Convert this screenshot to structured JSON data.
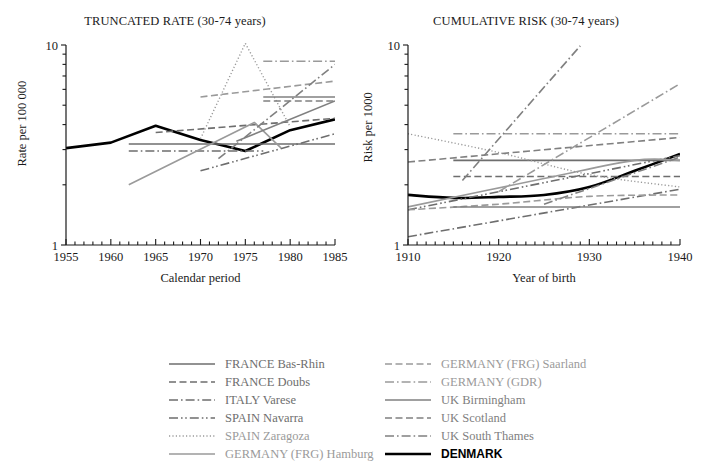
{
  "figure": {
    "background": "#ffffff",
    "width": 702,
    "height": 470
  },
  "panels": {
    "left": {
      "title": "TRUNCATED RATE (30-74 years)",
      "ylabel": "Rate per 100 000",
      "xlabel": "Calendar period",
      "ytick_top": "10",
      "ytick_bottom": "1",
      "xticks": [
        "1955",
        "1960",
        "1965",
        "1970",
        "1975",
        "1980",
        "1985"
      ]
    },
    "right": {
      "title": "CUMULATIVE RISK (30-74 years)",
      "ylabel": "Risk per 1000",
      "xlabel": "Year of birth",
      "ytick_top": "10",
      "ytick_bottom": "1",
      "xticks": [
        "1910",
        "1920",
        "1930",
        "1940"
      ]
    }
  },
  "legend": {
    "columns": [
      [
        {
          "label": "FRANCE Bas-Rhin",
          "style": "solid",
          "color": "#6e6e6e",
          "width": 1.6
        },
        {
          "label": "FRANCE Doubs",
          "style": "dashed",
          "color": "#6e6e6e",
          "width": 1.6
        },
        {
          "label": "ITALY Varese",
          "style": "dashdot",
          "color": "#6e6e6e",
          "width": 1.6
        },
        {
          "label": "SPAIN Navarra",
          "style": "dashdotdot",
          "color": "#6e6e6e",
          "width": 1.6
        },
        {
          "label": "SPAIN Zaragoza",
          "style": "dotted",
          "color": "#9a9a9a",
          "width": 1.4
        },
        {
          "label": "GERMANY (FRG) Hamburg",
          "style": "solid",
          "color": "#9a9a9a",
          "width": 1.6
        }
      ],
      [
        {
          "label": "GERMANY (FRG) Saarland",
          "style": "dashed",
          "color": "#9a9a9a",
          "width": 1.6
        },
        {
          "label": "GERMANY (GDR)",
          "style": "dashdot",
          "color": "#9a9a9a",
          "width": 1.6
        },
        {
          "label": "UK Birmingham",
          "style": "solid",
          "color": "#808080",
          "width": 1.6
        },
        {
          "label": "UK Scotland",
          "style": "dashed",
          "color": "#808080",
          "width": 1.6
        },
        {
          "label": "UK South Thames",
          "style": "dashdot",
          "color": "#808080",
          "width": 1.6
        },
        {
          "label": "DENMARK",
          "style": "solid",
          "color": "#000000",
          "width": 2.6
        }
      ]
    ]
  },
  "chart_data": [
    {
      "id": "truncated-rate",
      "type": "line",
      "title": "TRUNCATED RATE (30-74 years)",
      "xlabel": "Calendar period",
      "ylabel": "Rate per 100 000",
      "xlim": [
        1955,
        1985
      ],
      "ylim": [
        1,
        10
      ],
      "yscale": "log",
      "xticks": [
        1955,
        1960,
        1965,
        1970,
        1975,
        1980,
        1985
      ],
      "yticks": [
        1,
        10
      ],
      "yminor": [
        2,
        3,
        4,
        5,
        6,
        7,
        8,
        9
      ],
      "grid": false,
      "legend_position": "below-figure",
      "series": [
        {
          "name": "DENMARK",
          "style": "solid",
          "color": "#000000",
          "width": 2.6,
          "x": [
            1955,
            1960,
            1965,
            1970,
            1975,
            1980,
            1985
          ],
          "y": [
            3.05,
            3.25,
            3.95,
            3.35,
            2.95,
            3.75,
            4.25
          ]
        },
        {
          "name": "FRANCE Bas-Rhin",
          "style": "solid",
          "color": "#6e6e6e",
          "width": 1.6,
          "x": [
            1962,
            1985
          ],
          "y": [
            3.2,
            3.2
          ]
        },
        {
          "name": "FRANCE Doubs",
          "style": "dashed",
          "color": "#6e6e6e",
          "width": 1.6,
          "x": [
            1965,
            1985
          ],
          "y": [
            3.65,
            4.3
          ]
        },
        {
          "name": "ITALY Varese",
          "style": "dashdot",
          "color": "#6e6e6e",
          "width": 1.6,
          "x": [
            1962,
            1977
          ],
          "y": [
            2.95,
            2.95
          ]
        },
        {
          "name": "SPAIN Navarra",
          "style": "dashdotdot",
          "color": "#6e6e6e",
          "width": 1.6,
          "x": [
            1970,
            1985
          ],
          "y": [
            2.35,
            3.6
          ]
        },
        {
          "name": "SPAIN Zaragoza",
          "style": "dotted",
          "color": "#9a9a9a",
          "width": 1.4,
          "x": [
            1970,
            1975,
            1980
          ],
          "y": [
            3.4,
            10.2,
            3.9
          ]
        },
        {
          "name": "GERMANY (FRG) Hamburg",
          "style": "solid",
          "color": "#9a9a9a",
          "width": 1.6,
          "x": [
            1962,
            1976,
            1979
          ],
          "y": [
            2.0,
            4.1,
            3.05
          ]
        },
        {
          "name": "GERMANY (FRG) Saarland",
          "style": "dashed",
          "color": "#9a9a9a",
          "width": 1.6,
          "x": [
            1970,
            1985
          ],
          "y": [
            5.5,
            6.6
          ]
        },
        {
          "name": "GERMANY (GDR)",
          "style": "dashdot",
          "color": "#9a9a9a",
          "width": 1.6,
          "x": [
            1977,
            1985
          ],
          "y": [
            8.3,
            8.3
          ]
        },
        {
          "name": "UK Birmingham",
          "style": "solid",
          "color": "#808080",
          "width": 1.6,
          "x": [
            1977,
            1985
          ],
          "y": [
            5.5,
            5.5
          ]
        },
        {
          "name": "UK Scotland",
          "style": "dashed",
          "color": "#808080",
          "width": 1.6,
          "x": [
            1977,
            1985
          ],
          "y": [
            5.25,
            5.25
          ]
        },
        {
          "name": "UK South Thames",
          "style": "dashdot",
          "color": "#808080",
          "width": 1.6,
          "x": [
            1972,
            1985
          ],
          "y": [
            2.7,
            8.0
          ]
        },
        {
          "name": "UK Birmingham trend",
          "style": "solid",
          "color": "#808080",
          "width": 1.6,
          "x": [
            1974,
            1985
          ],
          "y": [
            3.3,
            5.25
          ]
        }
      ]
    },
    {
      "id": "cumulative-risk",
      "type": "line",
      "title": "CUMULATIVE RISK (30-74 years)",
      "xlabel": "Year of birth",
      "ylabel": "Risk per 1000",
      "xlim": [
        1910,
        1940
      ],
      "ylim": [
        1,
        10
      ],
      "yscale": "log",
      "xticks": [
        1910,
        1920,
        1930,
        1940
      ],
      "yticks": [
        1,
        10
      ],
      "yminor": [
        2,
        3,
        4,
        5,
        6,
        7,
        8,
        9
      ],
      "grid": false,
      "legend_position": "below-figure",
      "series": [
        {
          "name": "DENMARK",
          "style": "solid",
          "color": "#000000",
          "width": 2.6,
          "x": [
            1910,
            1915,
            1920,
            1925,
            1930,
            1935,
            1940
          ],
          "y": [
            1.78,
            1.72,
            1.74,
            1.78,
            1.95,
            2.35,
            2.85
          ]
        },
        {
          "name": "FRANCE Bas-Rhin",
          "style": "solid",
          "color": "#6e6e6e",
          "width": 1.6,
          "x": [
            1915,
            1940
          ],
          "y": [
            2.65,
            2.65
          ]
        },
        {
          "name": "FRANCE Doubs",
          "style": "dashed",
          "color": "#6e6e6e",
          "width": 1.6,
          "x": [
            1915,
            1940
          ],
          "y": [
            2.2,
            2.2
          ]
        },
        {
          "name": "ITALY Varese",
          "style": "dashdot",
          "color": "#6e6e6e",
          "width": 1.6,
          "x": [
            1910,
            1940
          ],
          "y": [
            1.1,
            1.9
          ]
        },
        {
          "name": "SPAIN Navarra",
          "style": "dashdotdot",
          "color": "#6e6e6e",
          "width": 1.6,
          "x": [
            1910,
            1940
          ],
          "y": [
            1.5,
            2.8
          ]
        },
        {
          "name": "SPAIN Zaragoza",
          "style": "dotted",
          "color": "#9a9a9a",
          "width": 1.4,
          "x": [
            1910,
            1920,
            1930,
            1940
          ],
          "y": [
            3.6,
            2.9,
            2.25,
            1.95
          ]
        },
        {
          "name": "GERMANY (FRG) Hamburg",
          "style": "solid",
          "color": "#9a9a9a",
          "width": 1.6,
          "x": [
            1910,
            1925,
            1935,
            1940
          ],
          "y": [
            1.55,
            2.15,
            2.65,
            2.65
          ]
        },
        {
          "name": "GERMANY (FRG) Saarland",
          "style": "dashed",
          "color": "#9a9a9a",
          "width": 1.6,
          "x": [
            1910,
            1920,
            1930,
            1940
          ],
          "y": [
            1.5,
            1.6,
            1.75,
            1.78
          ]
        },
        {
          "name": "GERMANY (GDR)",
          "style": "dashdot",
          "color": "#9a9a9a",
          "width": 1.6,
          "x": [
            1915,
            1940
          ],
          "y": [
            3.6,
            3.6
          ]
        },
        {
          "name": "UK Birmingham",
          "style": "solid",
          "color": "#808080",
          "width": 1.6,
          "x": [
            1915,
            1940
          ],
          "y": [
            1.55,
            1.55
          ]
        },
        {
          "name": "UK Scotland",
          "style": "dashed",
          "color": "#808080",
          "width": 1.6,
          "x": [
            1910,
            1940
          ],
          "y": [
            2.6,
            3.45
          ]
        },
        {
          "name": "UK South Thames",
          "style": "dashdot",
          "color": "#808080",
          "width": 1.6,
          "x": [
            1916,
            1929
          ],
          "y": [
            2.1,
            9.9
          ]
        },
        {
          "name": "GERMANY (GDR) cohort",
          "style": "dashdot",
          "color": "#9a9a9a",
          "width": 1.6,
          "x": [
            1920,
            1940
          ],
          "y": [
            1.85,
            6.4
          ]
        },
        {
          "name": "UK Scotland cohort",
          "style": "dashdot",
          "color": "#808080",
          "width": 1.6,
          "x": [
            1925,
            1940
          ],
          "y": [
            1.6,
            2.75
          ]
        }
      ]
    }
  ]
}
